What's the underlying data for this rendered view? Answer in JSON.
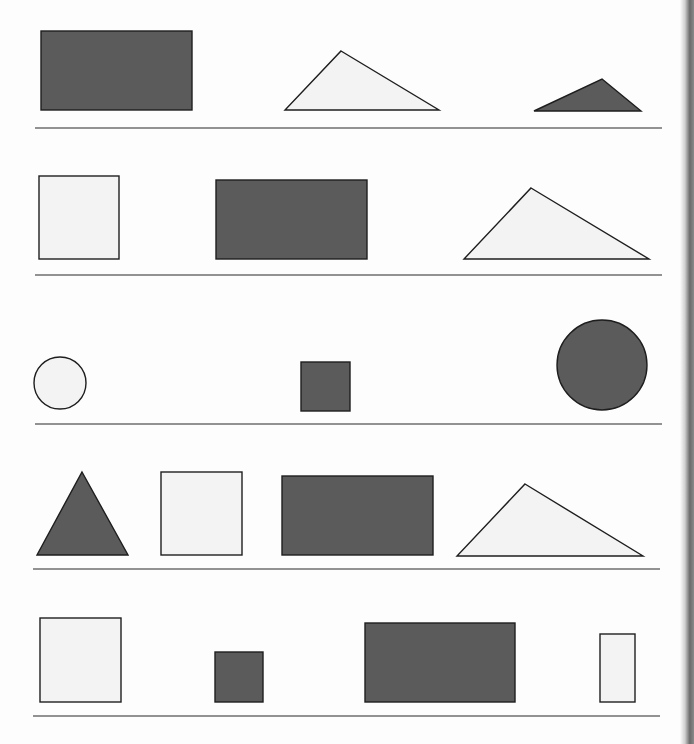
{
  "worksheet": {
    "colors": {
      "dark_fill": "#5b5b5b",
      "light_fill": "#f3f3f3",
      "stroke": "#1e1e1e",
      "rule_line": "#6e6e6e"
    },
    "rows": [
      {
        "baseline": {
          "x1": 35,
          "x2": 662,
          "y": 128
        },
        "shapes": [
          {
            "type": "rect",
            "fill": "dark",
            "x": 41,
            "y": 31,
            "w": 151,
            "h": 79
          },
          {
            "type": "triangle",
            "fill": "light",
            "points": [
              [
                341,
                51
              ],
              [
                439,
                110
              ],
              [
                285,
                110
              ]
            ]
          },
          {
            "type": "triangle",
            "fill": "dark",
            "points": [
              [
                602,
                79
              ],
              [
                641,
                111
              ],
              [
                534,
                111
              ]
            ]
          }
        ]
      },
      {
        "baseline": {
          "x1": 35,
          "x2": 662,
          "y": 275
        },
        "shapes": [
          {
            "type": "rect",
            "fill": "light",
            "x": 39,
            "y": 176,
            "w": 80,
            "h": 83
          },
          {
            "type": "rect",
            "fill": "dark",
            "x": 216,
            "y": 180,
            "w": 151,
            "h": 79
          },
          {
            "type": "triangle",
            "fill": "light",
            "points": [
              [
                531,
                188
              ],
              [
                649,
                259
              ],
              [
                464,
                259
              ]
            ]
          }
        ]
      },
      {
        "baseline": {
          "x1": 35,
          "x2": 662,
          "y": 424
        },
        "shapes": [
          {
            "type": "circle",
            "fill": "light",
            "cx": 60,
            "cy": 383,
            "r": 26
          },
          {
            "type": "rect",
            "fill": "dark",
            "x": 301,
            "y": 362,
            "w": 49,
            "h": 49
          },
          {
            "type": "circle",
            "fill": "dark",
            "cx": 602,
            "cy": 365,
            "r": 45
          }
        ]
      },
      {
        "baseline": {
          "x1": 33,
          "x2": 660,
          "y": 569
        },
        "shapes": [
          {
            "type": "triangle",
            "fill": "dark",
            "points": [
              [
                82,
                472
              ],
              [
                128,
                555
              ],
              [
                37,
                555
              ]
            ]
          },
          {
            "type": "rect",
            "fill": "light",
            "x": 161,
            "y": 472,
            "w": 81,
            "h": 83
          },
          {
            "type": "rect",
            "fill": "dark",
            "x": 282,
            "y": 476,
            "w": 151,
            "h": 79
          },
          {
            "type": "triangle",
            "fill": "light",
            "points": [
              [
                525,
                484
              ],
              [
                643,
                556
              ],
              [
                457,
                556
              ]
            ]
          }
        ]
      },
      {
        "baseline": {
          "x1": 33,
          "x2": 660,
          "y": 716
        },
        "shapes": [
          {
            "type": "rect",
            "fill": "light",
            "x": 40,
            "y": 618,
            "w": 81,
            "h": 84
          },
          {
            "type": "rect",
            "fill": "dark",
            "x": 215,
            "y": 652,
            "w": 48,
            "h": 50
          },
          {
            "type": "rect",
            "fill": "dark",
            "x": 365,
            "y": 623,
            "w": 150,
            "h": 79
          },
          {
            "type": "rect",
            "fill": "light",
            "x": 600,
            "y": 634,
            "w": 35,
            "h": 68
          }
        ]
      }
    ]
  }
}
